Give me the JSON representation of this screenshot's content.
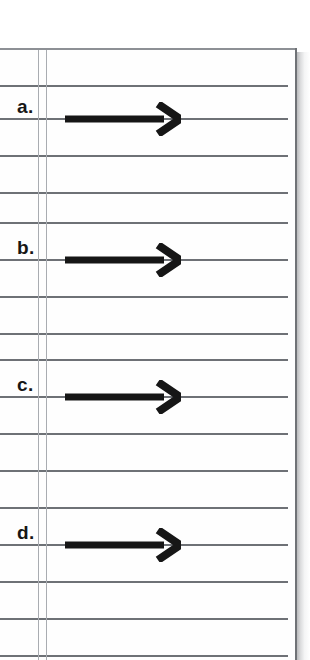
{
  "page": {
    "kind": "lined-worksheet-page",
    "background_color": "#ffffff",
    "paper_color": "#fefefe",
    "rule_color": "#6e7176",
    "margin_rule_color": "#a9acb1",
    "border_color": "#6f7276",
    "ink_color": "#161616"
  },
  "layout": {
    "paper_left": 0,
    "paper_top": 48,
    "paper_right": 297,
    "paper_bottom": 660,
    "rule_spacing": 37,
    "rule_start_y": 48,
    "rule_end_x": 288,
    "margin_rule_x": [
      38,
      46
    ]
  },
  "ruled_lines": [
    {
      "y": 48
    },
    {
      "y": 85
    },
    {
      "y": 118
    },
    {
      "y": 155
    },
    {
      "y": 192
    },
    {
      "y": 222
    },
    {
      "y": 259
    },
    {
      "y": 296
    },
    {
      "y": 333
    },
    {
      "y": 359
    },
    {
      "y": 396
    },
    {
      "y": 433
    },
    {
      "y": 470
    },
    {
      "y": 507
    },
    {
      "y": 544
    },
    {
      "y": 581
    },
    {
      "y": 618
    },
    {
      "y": 655
    }
  ],
  "items": [
    {
      "label": "a.",
      "label_x": 17,
      "label_y": 97,
      "line_y": 118,
      "arrow": {
        "x": 65,
        "tip_x": 179,
        "shaft_thickness": 7,
        "head_width": 22,
        "head_height": 30
      }
    },
    {
      "label": "b.",
      "label_y": 238,
      "label_x": 17,
      "line_y": 259,
      "arrow": {
        "x": 65,
        "tip_x": 179,
        "shaft_thickness": 7,
        "head_width": 22,
        "head_height": 30
      }
    },
    {
      "label": "c.",
      "label_x": 17,
      "label_y": 375,
      "line_y": 396,
      "arrow": {
        "x": 65,
        "tip_x": 179,
        "shaft_thickness": 7,
        "head_width": 22,
        "head_height": 30
      }
    },
    {
      "label": "d.",
      "label_x": 17,
      "label_y": 523,
      "line_y": 544,
      "arrow": {
        "x": 65,
        "tip_x": 179,
        "shaft_thickness": 7,
        "head_width": 22,
        "head_height": 30
      }
    }
  ]
}
